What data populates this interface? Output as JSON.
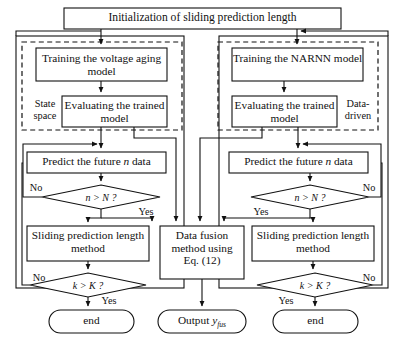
{
  "diagram": {
    "type": "flowchart",
    "title_box": {
      "label": "Initialization of sliding prediction length"
    },
    "groups": [
      {
        "id": "state-space",
        "label": "State space",
        "side": "left"
      },
      {
        "id": "data-driven",
        "label": "Data-driven",
        "side": "right"
      }
    ],
    "left_branch": {
      "train_box": "Training the voltage aging model",
      "evaluate_box": "Evaluating the trained model",
      "predict_box_pre": "Predict the future ",
      "predict_box_var": "n",
      "predict_box_post": " data",
      "decision_n": "n > N ?",
      "decision_n_no": "No",
      "decision_n_yes": "Yes",
      "sliding_box": "Sliding prediction length method",
      "decision_k": "k > K ?",
      "decision_k_no": "No",
      "decision_k_yes": "Yes",
      "terminal": "end"
    },
    "right_branch": {
      "train_box": "Training the NARNN model",
      "evaluate_box": "Evaluating the trained model",
      "predict_box_pre": "Predict the future ",
      "predict_box_var": "n",
      "predict_box_post": " data",
      "decision_n": "n > N ?",
      "decision_n_no": "No",
      "decision_n_yes": "Yes",
      "sliding_box": "Sliding prediction length method",
      "decision_k": "k > K ?",
      "decision_k_no": "No",
      "decision_k_yes": "Yes",
      "terminal": "end"
    },
    "center_branch": {
      "fusion_box_l1": "Data fusion",
      "fusion_box_l2": "method using",
      "fusion_box_l3": "Eq. (12)",
      "output_pre": "Output ",
      "output_var": "y",
      "output_sub": "fus"
    },
    "colors": {
      "stroke": "#111111",
      "text": "#111111",
      "background": "#ffffff",
      "dashed_stroke": "#222222"
    }
  }
}
